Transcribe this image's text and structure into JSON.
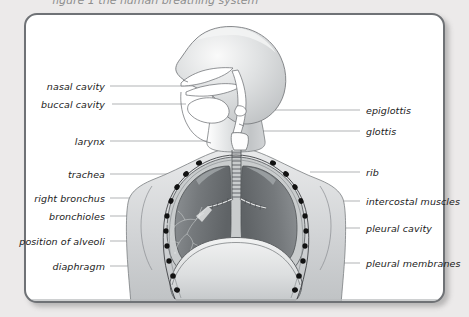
{
  "page": {
    "background_color": "#eceaea",
    "frame_border_color": "#6f7276",
    "frame_fill_color": "#ffffff",
    "clipped_caption": "figure 1  the human breathing system"
  },
  "diagram": {
    "orientation": "head in left-facing profile above a front-view thorax",
    "palette": {
      "body_light": "#d7d9da",
      "body_mid": "#b9bcbe",
      "lung_dark": "#6d7073",
      "lung_mid": "#84888b",
      "outline": "#6a6d70",
      "rib_dot": "#121212",
      "leader_line": "#8c8f92"
    }
  },
  "labels": {
    "left": [
      {
        "text": "nasal cavity",
        "text_x": 105,
        "y": 86,
        "line_to_x": 196
      },
      {
        "text": "buccal cavity",
        "text_x": 105,
        "y": 104,
        "line_to_x": 186
      },
      {
        "text": "larynx",
        "text_x": 105,
        "y": 141,
        "line_to_x": 214
      },
      {
        "text": "trachea",
        "text_x": 105,
        "y": 174,
        "line_to_x": 228
      },
      {
        "text": "right bronchus",
        "text_x": 105,
        "y": 198,
        "line_to_x": 215
      },
      {
        "text": "bronchioles",
        "text_x": 105,
        "y": 216,
        "line_to_x": 208
      },
      {
        "text": "position of alveoli",
        "text_x": 105,
        "y": 241,
        "line_to_x": 196
      },
      {
        "text": "diaphragm",
        "text_x": 105,
        "y": 266,
        "line_to_x": 176
      }
    ],
    "right": [
      {
        "text": "epiglottis",
        "text_x": 366,
        "y": 110,
        "line_from_x": 246
      },
      {
        "text": "glottis",
        "text_x": 366,
        "y": 131,
        "line_from_x": 242
      },
      {
        "text": "rib",
        "text_x": 366,
        "y": 172,
        "line_from_x": 310
      },
      {
        "text": "intercostal muscles",
        "text_x": 366,
        "y": 201,
        "line_from_x": 315
      },
      {
        "text": "pleural cavity",
        "text_x": 366,
        "y": 228,
        "line_from_x": 312
      },
      {
        "text": "pleural membranes",
        "text_x": 366,
        "y": 263,
        "line_from_x": 300
      }
    ]
  },
  "anatomy_parts": [
    "nasal cavity",
    "buccal cavity",
    "larynx",
    "trachea",
    "right bronchus",
    "bronchioles",
    "position of alveoli",
    "diaphragm",
    "epiglottis",
    "glottis",
    "rib",
    "intercostal muscles",
    "pleural cavity",
    "pleural membranes"
  ]
}
